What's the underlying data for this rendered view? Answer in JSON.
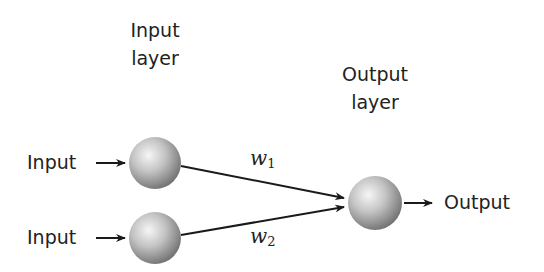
{
  "diagram": {
    "type": "single-layer-perceptron",
    "layers": [
      {
        "id": "input-layer",
        "title_line1": "Input",
        "title_line2": "layer"
      },
      {
        "id": "output-layer",
        "title_line1": "Output",
        "title_line2": "layer"
      }
    ],
    "inputs": [
      {
        "label": "Input"
      },
      {
        "label": "Input"
      }
    ],
    "output": {
      "label": "Output"
    },
    "weights": [
      {
        "symbol": "w",
        "subscript": "1"
      },
      {
        "symbol": "w",
        "subscript": "2"
      }
    ],
    "nodes": [
      {
        "id": "input-node-1",
        "cx": 155,
        "cy": 163,
        "r": 26
      },
      {
        "id": "input-node-2",
        "cx": 155,
        "cy": 238,
        "r": 26
      },
      {
        "id": "output-node",
        "cx": 375,
        "cy": 203,
        "r": 27
      }
    ],
    "colors": {
      "line": "#1a1a1a",
      "text": "#222222",
      "node_light": "#f4f4f4",
      "node_dark": "#7a7a7a"
    }
  }
}
